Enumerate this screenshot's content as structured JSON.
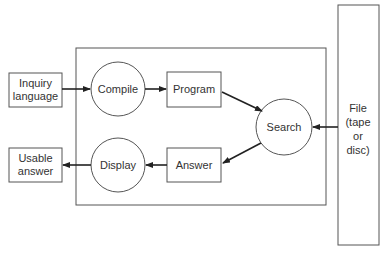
{
  "diagram": {
    "nodes": {
      "inquiry": {
        "line1": "Inquiry",
        "line2": "language",
        "shape": "rect"
      },
      "compile": {
        "label": "Compile",
        "shape": "circle"
      },
      "program": {
        "label": "Program",
        "shape": "rect"
      },
      "search": {
        "label": "Search",
        "shape": "circle"
      },
      "file": {
        "line1": "File",
        "line2": "(tape",
        "line3": "or",
        "line4": "disc)",
        "shape": "rect"
      },
      "answer": {
        "label": "Answer",
        "shape": "rect"
      },
      "display": {
        "label": "Display",
        "shape": "circle"
      },
      "usable": {
        "line1": "Usable",
        "line2": "answer",
        "shape": "rect"
      }
    },
    "edges": [
      {
        "from": "inquiry",
        "to": "compile"
      },
      {
        "from": "compile",
        "to": "program"
      },
      {
        "from": "program",
        "to": "search"
      },
      {
        "from": "file",
        "to": "search"
      },
      {
        "from": "search",
        "to": "answer"
      },
      {
        "from": "answer",
        "to": "display"
      },
      {
        "from": "display",
        "to": "usable"
      }
    ],
    "colors": {
      "stroke": "#444444",
      "text": "#333333",
      "background": "#ffffff"
    }
  }
}
